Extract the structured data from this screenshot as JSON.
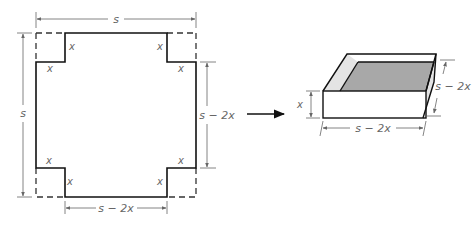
{
  "figure": {
    "left": {
      "top_dimension": "s",
      "left_dimension": "s",
      "right_dimension": "s − 2x",
      "bottom_dimension": "s − 2x",
      "corner_labels": [
        "x",
        "x",
        "x",
        "x",
        "x",
        "x",
        "x",
        "x"
      ]
    },
    "right": {
      "height_label": "x",
      "width_label": "s − 2x",
      "depth_label": "s − 2x"
    },
    "colors": {
      "line": "#111111",
      "dim": "#666666",
      "box_floor": "#a8a8a8",
      "box_side": "#e4e4e4"
    }
  }
}
